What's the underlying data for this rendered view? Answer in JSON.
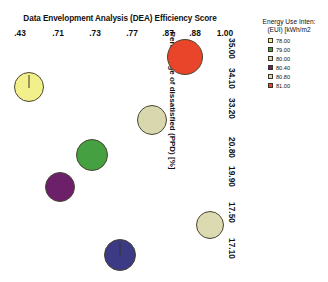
{
  "chart_data": {
    "type": "scatter",
    "title": "Data Envelopment Analysis (DEA) Efficiency Score",
    "xlabel": "Data Envelopment Analysis (DEA) Efficiency Score",
    "ylabel": "Percentage of dissatisfied (PPD) [%]",
    "xlabel_position": "top",
    "ylabel_position": "right",
    "grid": false,
    "legend_position": "top-right",
    "x_ticks": [
      ".43",
      ".71",
      ".73",
      ".77",
      ".87",
      ".88",
      "1.00"
    ],
    "x_values": [
      0.43,
      0.71,
      0.73,
      0.77,
      0.87,
      0.88,
      1.0
    ],
    "y_ticks": [
      "35.00",
      "34.10",
      "33.20",
      "20.80",
      "19.90",
      "17.50",
      "17.10"
    ],
    "y_values": [
      35.0,
      34.1,
      33.2,
      20.8,
      19.9,
      17.5,
      17.1
    ],
    "series": [
      {
        "name": "buildings",
        "points": [
          {
            "x": 0.88,
            "y": 35.0,
            "size": 81.0,
            "color": "#e8452a",
            "label": "1.00 / 35.00 / 81.00"
          },
          {
            "x": 0.43,
            "y": 34.1,
            "size": 78.0,
            "color": "#f2f08a",
            "label": ".43 / 34.10 / 78.00"
          },
          {
            "x": 0.77,
            "y": 33.2,
            "size": 80.4,
            "color": "#d9d7ae",
            "label": ".87 / 33.20 / 80.40"
          },
          {
            "x": 0.73,
            "y": 20.8,
            "size": 79.0,
            "color": "#45a041",
            "label": ".73 / 20.80 / 79.00"
          },
          {
            "x": 0.71,
            "y": 19.9,
            "size": 80.0,
            "color": "#6b2069",
            "label": ".71 / 19.90 / 80.00"
          },
          {
            "x": 0.87,
            "y": 17.5,
            "size": 80.8,
            "color": "#dcdab0",
            "label": ".88 / 17.50 / 80.80"
          },
          {
            "x": 0.73,
            "y": 17.1,
            "size": 80.0,
            "color": "#3c3a85",
            "label": ".77 / 17.10 / 80.00"
          }
        ]
      }
    ]
  },
  "legend": {
    "title_line1": "Energy Use Inten:",
    "title_line2": "(EUI) [kWh/m2",
    "items": [
      {
        "label": "78.00",
        "color": "#f2f08a"
      },
      {
        "label": "79.00",
        "color": "#45a041"
      },
      {
        "label": "80.00",
        "color": "#d9d7ae"
      },
      {
        "label": "80.40",
        "color": "#6b2069"
      },
      {
        "label": "80.80",
        "color": "#dcdab0"
      },
      {
        "label": "81.00",
        "color": "#e8452a"
      }
    ]
  }
}
